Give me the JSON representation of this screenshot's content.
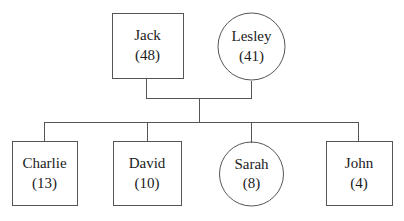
{
  "diagram": {
    "type": "family-tree",
    "stroke_color": "#555555",
    "text_color": "#1b1b1b",
    "background_color": "#ffffff",
    "stroke_width": 1,
    "generations": [
      {
        "level": "parents",
        "people": [
          {
            "id": "jack",
            "name": "Jack",
            "age": "(48)",
            "shape": "rect",
            "x": 112,
            "y": 13,
            "width": 71,
            "height": 65
          },
          {
            "id": "lesley",
            "name": "Lesley",
            "age": "(41)",
            "shape": "circle",
            "cx": 251.5,
            "cy": 46.5,
            "r": 33.5
          }
        ]
      },
      {
        "level": "children",
        "people": [
          {
            "id": "charlie",
            "name": "Charlie",
            "age": "(13)",
            "shape": "rect",
            "x": 12,
            "y": 141,
            "width": 65,
            "height": 65
          },
          {
            "id": "david",
            "name": "David",
            "age": "(10)",
            "shape": "rect",
            "x": 113,
            "y": 141,
            "width": 68,
            "height": 65
          },
          {
            "id": "sarah",
            "name": "Sarah",
            "age": "(8)",
            "shape": "circle",
            "cx": 251.5,
            "cy": 174,
            "r": 32
          },
          {
            "id": "john",
            "name": "John",
            "age": "(4)",
            "shape": "rect",
            "x": 326,
            "y": 141,
            "width": 66,
            "height": 65
          }
        ]
      }
    ],
    "connectors": {
      "jack_drop": {
        "x": 146,
        "y1": 78,
        "y2": 98
      },
      "lesley_drop": {
        "x": 252,
        "y1": 80,
        "y2": 98
      },
      "marriage_bar": {
        "x1": 146,
        "x2": 252,
        "y": 98
      },
      "center_drop": {
        "x": 199,
        "y1": 98,
        "y2": 122
      },
      "sibling_bar": {
        "x1": 44,
        "x2": 359,
        "y": 122
      },
      "child_drops": [
        {
          "id": "charlie",
          "x": 44,
          "y1": 122,
          "y2": 141
        },
        {
          "id": "david",
          "x": 147,
          "y1": 122,
          "y2": 141
        },
        {
          "id": "sarah",
          "x": 252,
          "y1": 122,
          "y2": 142
        },
        {
          "id": "john",
          "x": 359,
          "y1": 122,
          "y2": 141
        }
      ]
    }
  }
}
